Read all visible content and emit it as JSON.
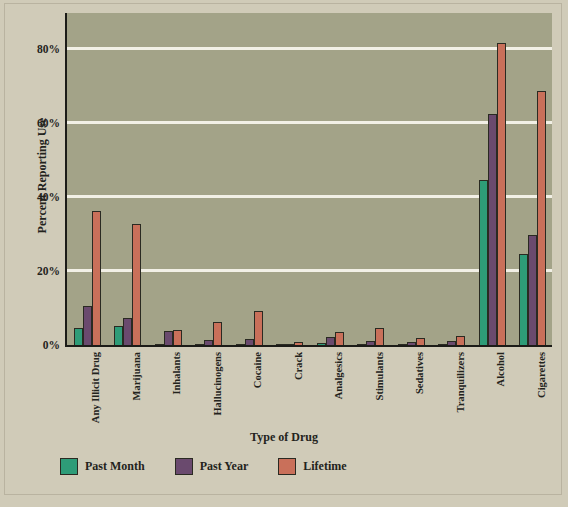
{
  "chart_data": {
    "type": "bar",
    "title": "",
    "xlabel": "Type of Drug",
    "ylabel": "Percent Reporting Use",
    "ylim": [
      0,
      90
    ],
    "yticks": [
      "0%",
      "20%",
      "40%",
      "60%",
      "80%"
    ],
    "ytick_values": [
      0,
      20,
      40,
      60,
      80
    ],
    "grid": "horizontal",
    "legend_position": "bottom-left",
    "categories": [
      "Any Illicit Drug",
      "Marijuana",
      "Inhalants",
      "Hallucinogens",
      "Cocaine",
      "Crack",
      "Analgesics",
      "Stimulants",
      "Sedatives",
      "Tranquilizers",
      "Alcohol",
      "Cigarettes"
    ],
    "series": [
      {
        "name": "Past Month",
        "color": "#2e9c78",
        "values": [
          4.9,
          5.5,
          0.3,
          0.4,
          0.4,
          0.2,
          0.7,
          0.6,
          0.4,
          0.4,
          45.0,
          25.0
        ]
      },
      {
        "name": "Past Year",
        "color": "#6a4a6e",
        "values": [
          10.9,
          7.6,
          4.0,
          1.5,
          2.0,
          0.6,
          2.5,
          1.4,
          1.0,
          1.3,
          62.8,
          30.0
        ]
      },
      {
        "name": "Lifetime",
        "color": "#c9705a",
        "values": [
          36.6,
          33.0,
          4.2,
          6.6,
          9.5,
          1.0,
          3.8,
          4.8,
          2.2,
          2.7,
          82.0,
          68.8
        ]
      }
    ]
  },
  "legend": {
    "items": [
      {
        "label": "Past Month",
        "color": "#2e9c78"
      },
      {
        "label": "Past Year",
        "color": "#6a4a6e"
      },
      {
        "label": "Lifetime",
        "color": "#c9705a"
      }
    ]
  },
  "colors": {
    "page_background": "#d0cbb8",
    "plot_background": "#a3a388",
    "gridline": "#f2f0e6",
    "axis": "#1c1c18",
    "text": "#23231c"
  }
}
